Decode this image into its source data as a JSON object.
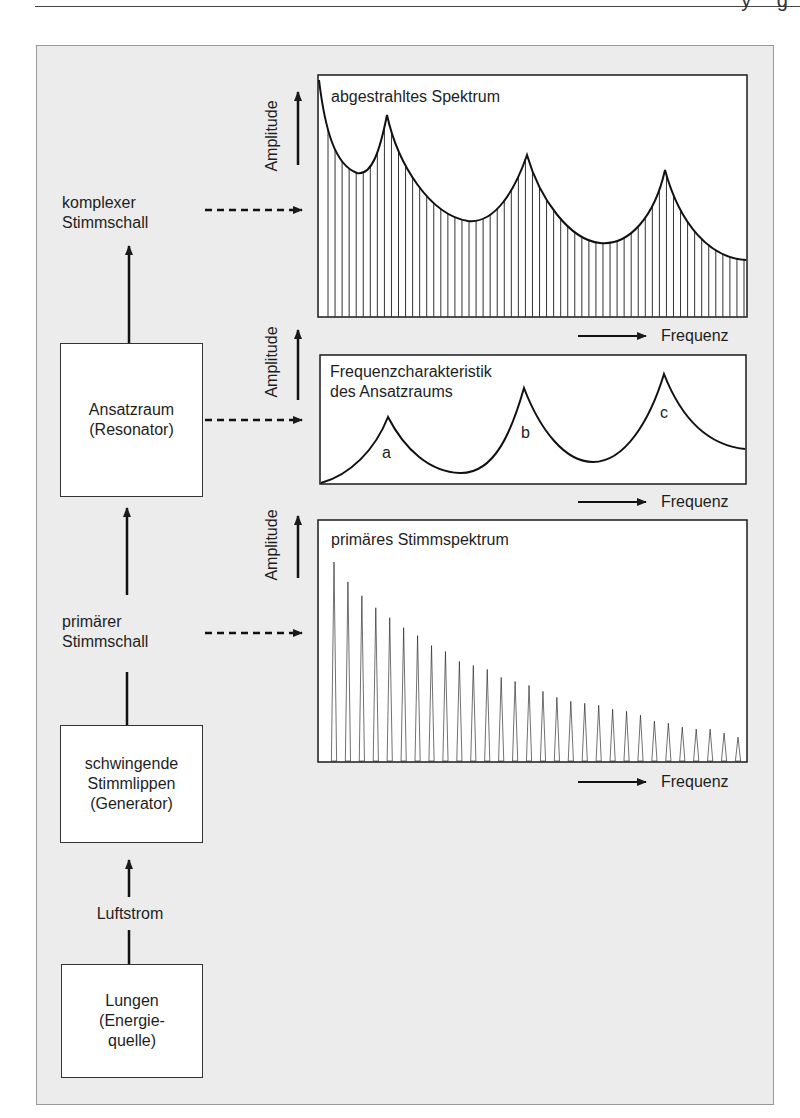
{
  "header": {
    "partial_text": "y g"
  },
  "flow": {
    "complex_sound": {
      "line1": "komplexer",
      "line2": "Stimmschall"
    },
    "resonator_box": {
      "line1": "Ansatzraum",
      "line2": "(Resonator)"
    },
    "primary_sound": {
      "line1": "primärer",
      "line2": "Stimmschall"
    },
    "generator_box": {
      "line1": "schwingende",
      "line2": "Stimmlippen",
      "line3": "(Generator)"
    },
    "airflow": {
      "label": "Luftstrom"
    },
    "lungs_box": {
      "line1": "Lungen",
      "line2": "(Energie-",
      "line3": "quelle)"
    }
  },
  "axes": {
    "y_label": "Amplitude",
    "x_label": "Frequenz"
  },
  "chart_data": [
    {
      "type": "bar",
      "title": "abgestrahltes Spektrum",
      "xlabel": "Frequenz",
      "ylabel": "Amplitude",
      "description": "Radiated spectrum: dense harmonic lines (≈60) under an envelope with three formant peaks",
      "envelope_peaks_x_fraction": [
        0.16,
        0.49,
        0.81
      ],
      "envelope_peaks_relative_height": [
        0.83,
        0.67,
        0.61
      ],
      "envelope_troughs_relative_height": [
        0.6,
        0.4,
        0.31
      ],
      "envelope_end_relative_height": 0.24,
      "harmonic_count": 60,
      "grid": false
    },
    {
      "type": "line",
      "title": "Frequenzcharakteristik des Ansatzraums",
      "xlabel": "Frequenz",
      "ylabel": "Amplitude",
      "peaks": [
        {
          "label": "a",
          "x_fraction": 0.16,
          "relative_height": 0.52
        },
        {
          "label": "b",
          "x_fraction": 0.48,
          "relative_height": 0.75
        },
        {
          "label": "c",
          "x_fraction": 0.8,
          "relative_height": 0.86
        }
      ],
      "troughs_relative_height": [
        0.08,
        0.17
      ],
      "start_relative_height": 0.0,
      "end_relative_height": 0.27,
      "grid": false
    },
    {
      "type": "bar",
      "title": "primäres Stimmspektrum",
      "xlabel": "Frequenz",
      "ylabel": "Amplitude",
      "description": "Primary voice spectrum: 30 harmonics with monotonically decreasing amplitude",
      "categories": [
        1,
        2,
        3,
        4,
        5,
        6,
        7,
        8,
        9,
        10,
        11,
        12,
        13,
        14,
        15,
        16,
        17,
        18,
        19,
        20,
        21,
        22,
        23,
        24,
        25,
        26,
        27,
        28,
        29,
        30
      ],
      "values": [
        100,
        90,
        83,
        77,
        72,
        67,
        63,
        58,
        55,
        50,
        48,
        46,
        42,
        40,
        38,
        35,
        32,
        30,
        29,
        28,
        26,
        25,
        23,
        20,
        19,
        17,
        16,
        16,
        14,
        12
      ],
      "ylim": [
        0,
        100
      ],
      "grid": false
    }
  ],
  "colors": {
    "background": "#ececec",
    "panel": "#ffffff",
    "line": "#1a1a1a"
  }
}
